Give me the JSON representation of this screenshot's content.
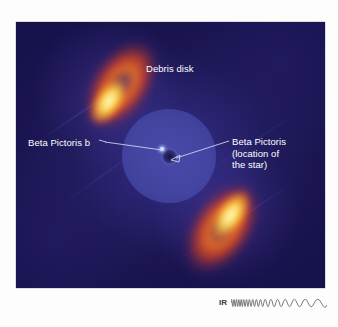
{
  "figure": {
    "image_background_color": "#211c5e",
    "label_text_color": "#ffffff",
    "leader_line_color": "#c9d2ef"
  },
  "annotations": [
    {
      "id": "debris-disk",
      "lines": [
        "Debris disk"
      ],
      "has_leader_line": false
    },
    {
      "id": "beta-pictoris-b",
      "lines": [
        "Beta Pictoris b"
      ],
      "has_leader_line": true
    },
    {
      "id": "beta-pictoris-star",
      "lines": [
        "Beta Pictoris",
        "(location of",
        "the star)"
      ],
      "has_leader_line": true
    }
  ],
  "labels": {
    "debris_disk": "Debris disk",
    "planet": "Beta Pictoris b",
    "star_line1": "Beta Pictoris",
    "star_line2": "(location of",
    "star_line3": "the star)"
  },
  "ir_key": {
    "label": "IR",
    "label_color": "#3a3a3a",
    "description": "infrared wavelength indicator, short-to-long wave sweep"
  },
  "features": {
    "coronagraph_mask": "circular occulting disk over the star",
    "upper_lobe": "northeast debris disk lobe",
    "lower_lobe": "southwest debris disk lobe",
    "planet_marker": "bright point source left of center",
    "star_marker": "arrow pointing to stellar position"
  }
}
